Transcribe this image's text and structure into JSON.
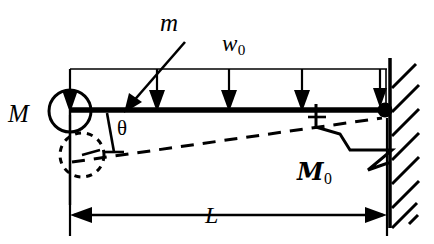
{
  "figure": {
    "kind": "structural-beam-diagram",
    "background_color": "#ffffff",
    "line_color": "#000000"
  },
  "labels": {
    "mass": "M",
    "mass_small": "m",
    "distributed_load": "w",
    "distributed_load_sub": "0",
    "angle": "θ",
    "spring_moment": "M",
    "spring_moment_sub": "0",
    "span": "L"
  },
  "geometry": {
    "beam": {
      "x_left": 70,
      "x_right": 387,
      "y": 110,
      "thickness": 5
    },
    "load_box": {
      "x_left": 70,
      "x_right": 387,
      "y_top": 69,
      "y_beam": 110
    },
    "load_arrows_x": [
      72,
      157,
      229,
      302,
      385
    ],
    "mass_circle": {
      "cx": 70,
      "cy": 111,
      "r": 21
    },
    "mass_arrow": {
      "x": 70,
      "y_top": 69,
      "y_tip": 112
    },
    "displaced_mass_circle": {
      "cx": 82,
      "cy": 155,
      "r": 22,
      "dashed": true
    },
    "deflection_line": {
      "x_start": 72,
      "y_start": 162,
      "x_end": 382,
      "y_end": 118,
      "dashed": true
    },
    "angle_tick": {
      "x_top": 108,
      "y_top": 113,
      "x_bot": 114,
      "y_bot": 152
    },
    "support_pin": {
      "cx": 385,
      "cy": 110,
      "r": 7
    },
    "wall": {
      "x": 390,
      "y_top": 60,
      "y_bottom": 226,
      "hatch_count": 7
    },
    "spring_zigzag": {
      "points": "318,114 318,128 342,136 352,150 394,150 370,168 386,162"
    },
    "dimension_line": {
      "x_left": 70,
      "x_right": 387,
      "y": 215
    },
    "extension_lines": {
      "left_x": 70,
      "right_x": 387,
      "y_top": 115,
      "y_bottom": 235
    }
  }
}
